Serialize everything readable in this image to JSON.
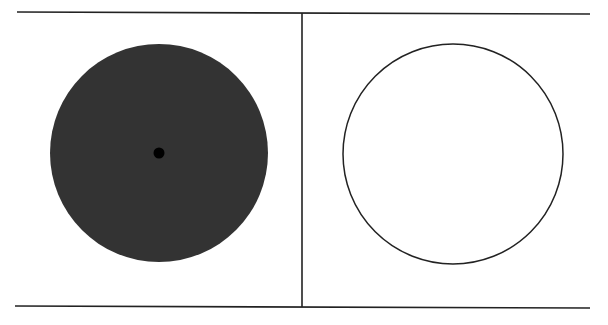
{
  "diagram": {
    "frame": {
      "top_line": {
        "x1": 17,
        "y1": 12,
        "x2": 590,
        "y2": 14
      },
      "bottom_line": {
        "x1": 15,
        "y1": 306,
        "x2": 590,
        "y2": 308
      },
      "divider": {
        "x1": 302,
        "y1": 13,
        "x2": 302,
        "y2": 307
      },
      "stroke": "#222222"
    },
    "panels": [
      {
        "name": "left",
        "shape": "filled-disc",
        "cx": 159,
        "cy": 153,
        "r": 109,
        "fill": "#333333",
        "center_dot": {
          "cx": 159,
          "cy": 153,
          "r": 5.5,
          "fill": "#000000"
        }
      },
      {
        "name": "right",
        "shape": "circle-outline",
        "cx": 453,
        "cy": 154,
        "r": 110,
        "fill": "#ffffff",
        "stroke": "#222222",
        "stroke_width": 1.5
      }
    ]
  }
}
